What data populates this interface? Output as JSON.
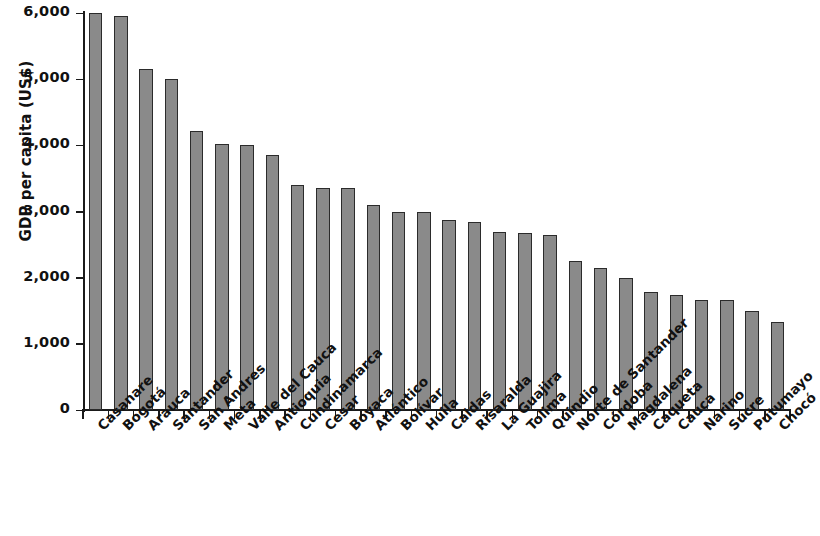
{
  "chart_data": {
    "type": "bar",
    "title": "",
    "subtitle": "",
    "xlabel": "",
    "ylabel": "GDP per capita (US$)",
    "ylim": [
      0,
      6000
    ],
    "yticks": [
      0,
      1000,
      2000,
      3000,
      4000,
      5000,
      6000
    ],
    "ytick_labels": [
      "0",
      "1,000",
      "2,000",
      "3,000",
      "4,000",
      "5,000",
      "6,000"
    ],
    "grid": false,
    "legend": null,
    "bar_color": "#8a8a8a",
    "bar_edge_color": "#2b2b2b",
    "categories": [
      "Casanare",
      "Bogotá",
      "Arauca",
      "Santander",
      "San Andres",
      "Meta",
      "Valle del Cauca",
      "Antioquia",
      "Cundinamarca",
      "Cesar",
      "Boyaca",
      "Atlántico",
      "Bolívar",
      "Huila",
      "Caldas",
      "Risaralda",
      "La Guajira",
      "Tolima",
      "Quindio",
      "Norte de Santander",
      "Córdoba",
      "Magdalena",
      "Caqueta",
      "Cauca",
      "Narino",
      "Sucre",
      "Putumayo",
      "Chocó"
    ],
    "values": [
      6000,
      5950,
      5160,
      5010,
      4210,
      4020,
      4010,
      3860,
      3400,
      3360,
      3360,
      3100,
      2990,
      2990,
      2870,
      2840,
      2690,
      2670,
      2650,
      2250,
      2150,
      2000,
      1790,
      1740,
      1660,
      1670,
      1500,
      1330
    ]
  }
}
